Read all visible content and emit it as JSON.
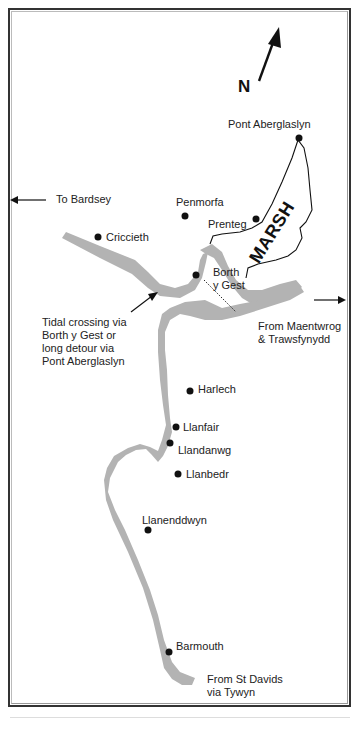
{
  "map": {
    "title": "Route map: Barmouth to Bardsey",
    "compass": {
      "label": "N",
      "icon": "north-arrow-icon"
    },
    "region_label": "MARSH",
    "places": [
      {
        "name": "Pont Aberglaslyn",
        "dot": [
          299,
          138
        ],
        "label_pos": [
          228,
          118
        ]
      },
      {
        "name": "Penmorfa",
        "dot": [
          185,
          216
        ],
        "label_pos": [
          176,
          196
        ]
      },
      {
        "name": "Prenteg",
        "dot": [
          256,
          219
        ],
        "label_pos": [
          208,
          218
        ]
      },
      {
        "name": "Criccieth",
        "dot": [
          98,
          237
        ],
        "label_pos": [
          106,
          231
        ]
      },
      {
        "name": "Borth\ny Gest",
        "dot": [
          196,
          275
        ],
        "label_pos": [
          213,
          266
        ]
      },
      {
        "name": "Harlech",
        "dot": [
          190,
          391
        ],
        "label_pos": [
          198,
          383
        ]
      },
      {
        "name": "Llanfair",
        "dot": [
          176,
          427
        ],
        "label_pos": [
          183,
          421
        ]
      },
      {
        "name": "Llandanwg",
        "dot": [
          170,
          443
        ],
        "label_pos": [
          178,
          444
        ]
      },
      {
        "name": "Llanbedr",
        "dot": [
          178,
          474
        ],
        "label_pos": [
          186,
          468
        ]
      },
      {
        "name": "Llanenddwyn",
        "dot": [
          148,
          530
        ],
        "label_pos": [
          142,
          514
        ]
      },
      {
        "name": "Barmouth",
        "dot": [
          169,
          652
        ],
        "label_pos": [
          176,
          640
        ]
      }
    ],
    "annotations": {
      "to_bardsey": "To Bardsey",
      "tidal_crossing": "Tidal crossing via\nBorth y Gest or\nlong detour via\nPont Aberglaslyn",
      "from_maentwrog": "From Maentwrog\n& Trawsfynydd",
      "from_st_davids": "From St Davids\nvia Tywyn"
    },
    "colors": {
      "route": "#b3b3b3",
      "ink": "#111111",
      "frame": "#333333",
      "background": "#ffffff"
    }
  }
}
